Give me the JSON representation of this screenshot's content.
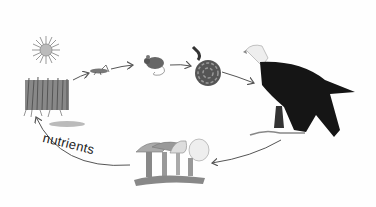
{
  "diagram": {
    "type": "food chain / nutrient cycle",
    "organisms": [
      {
        "id": "sun",
        "name": "sun",
        "role": "energy source"
      },
      {
        "id": "grass",
        "name": "grass",
        "role": "producer"
      },
      {
        "id": "grasshopper",
        "name": "grasshopper",
        "role": "primary consumer"
      },
      {
        "id": "mouse",
        "name": "mouse",
        "role": "secondary consumer"
      },
      {
        "id": "snake",
        "name": "snake",
        "role": "tertiary consumer"
      },
      {
        "id": "eagle",
        "name": "bald eagle",
        "role": "top predator"
      },
      {
        "id": "mushrooms",
        "name": "mushrooms",
        "role": "decomposer"
      }
    ],
    "arrows": [
      {
        "from": "grass",
        "to": "grasshopper"
      },
      {
        "from": "grasshopper",
        "to": "mouse"
      },
      {
        "from": "mouse",
        "to": "snake"
      },
      {
        "from": "snake",
        "to": "eagle"
      },
      {
        "from": "eagle",
        "to": "mushrooms"
      },
      {
        "from": "mushrooms",
        "to": "grass",
        "label": "nutrients"
      }
    ],
    "labels": {
      "nutrients": "nutrients"
    }
  }
}
